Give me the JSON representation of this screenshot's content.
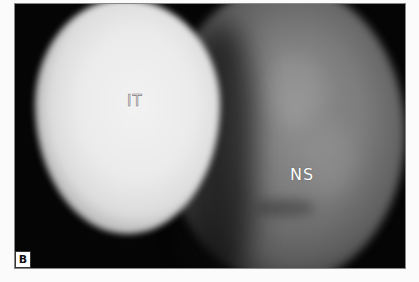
{
  "figure": {
    "panel_label": "B",
    "labels": {
      "inferior_turbinate": "IT",
      "nasal_septum": "NS"
    },
    "colors": {
      "background": "#050505",
      "it_tissue": "#ebebeb",
      "ns_tissue": "#7d7d7d",
      "page": "#fbfbfb"
    }
  }
}
